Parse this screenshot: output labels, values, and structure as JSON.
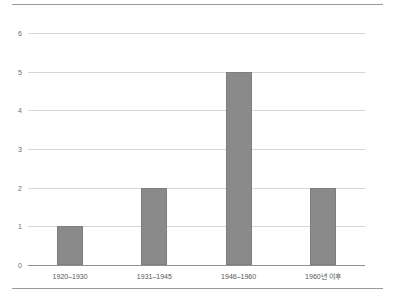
{
  "chart_data": {
    "type": "bar",
    "title": "",
    "subtitle": "",
    "xlabel": "",
    "ylabel": "",
    "categories": [
      "1920–1930",
      "1931–1945",
      "1946–1960",
      "1960년 이후"
    ],
    "values": [
      1,
      2,
      5,
      2
    ],
    "ylim": [
      0,
      6
    ],
    "ytick_labels": [
      "0",
      "1",
      "2",
      "3",
      "4",
      "5",
      "6"
    ],
    "ytick_values": [
      0,
      1,
      2,
      3,
      4,
      5,
      6
    ],
    "grid": true,
    "legend": false,
    "legend_position": "none",
    "bar_color": "#8a8a8a",
    "bar_border_color": "#7e7e7e",
    "gridline_color": "#d6d6d6",
    "axis_color": "#8f8f8f",
    "tick_label_color": "#6d6d6d",
    "category_label_color": "#555555",
    "background_color": "#ffffff",
    "rule_color": "#9a9a9a",
    "series": [
      {
        "name": "",
        "values": [
          1,
          2,
          5,
          2
        ]
      }
    ]
  }
}
